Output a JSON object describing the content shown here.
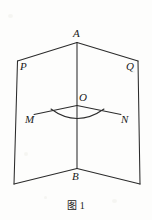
{
  "figure": {
    "caption_label": "图",
    "caption_number": "1",
    "stroke_color": "#2b2b2b",
    "background_color": "#fdfdfc",
    "labels": {
      "apex_top": "A",
      "apex_bottom": "B",
      "plane_left": "P",
      "plane_right": "Q",
      "origin": "O",
      "ray_left": "M",
      "ray_right": "N"
    },
    "geometry": {
      "type": "dihedral-angle-diagram",
      "description": "Two vertical half-planes P and Q meeting along edge AB, with segment MON lying across the dihedral angle at point O and an arc marking angle MON",
      "points": {
        "A": [
          77,
          42
        ],
        "B": [
          77,
          168
        ],
        "P_top": [
          17,
          61
        ],
        "P_bottom": [
          14,
          184
        ],
        "Q_top": [
          138,
          61
        ],
        "Q_bottom": [
          140,
          184
        ],
        "O": [
          77,
          106
        ],
        "M": [
          34,
          114
        ],
        "N": [
          121,
          114
        ]
      },
      "edges": [
        [
          "A",
          "P_top"
        ],
        [
          "A",
          "Q_top"
        ],
        [
          "P_top",
          "P_bottom"
        ],
        [
          "Q_top",
          "Q_bottom"
        ],
        [
          "P_bottom",
          "B"
        ],
        [
          "Q_bottom",
          "B"
        ],
        [
          "A",
          "B"
        ],
        [
          "M",
          "O"
        ],
        [
          "O",
          "N"
        ]
      ],
      "arc": {
        "from": "M_side",
        "to": "N_side",
        "label": "angle-MON-arc"
      }
    }
  }
}
